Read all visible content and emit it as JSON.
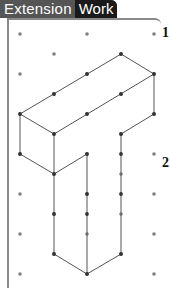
{
  "header": {
    "tab_label_1": "Extension",
    "tab_label_2": "Work"
  },
  "questions": [
    {
      "number": "1",
      "x": 162,
      "y": 34
    },
    {
      "number": "2",
      "x": 162,
      "y": 164
    }
  ],
  "grid": {
    "columns_x": [
      20,
      54,
      87,
      121,
      154
    ],
    "row_spacing": 20,
    "dot_color": "#808080"
  },
  "shape": {
    "description": "Isometric drawing of a T-shaped solid on isometric dot paper",
    "line_color": "#555555",
    "vertex_color": "#333333",
    "edges": [
      [
        [
          121,
          54
        ],
        [
          154,
          74
        ]
      ],
      [
        [
          121,
          54
        ],
        [
          20,
          114
        ]
      ],
      [
        [
          154,
          74
        ],
        [
          54,
          134
        ]
      ],
      [
        [
          20,
          114
        ],
        [
          54,
          134
        ]
      ],
      [
        [
          154,
          74
        ],
        [
          154,
          114
        ]
      ],
      [
        [
          154,
          114
        ],
        [
          121,
          134
        ]
      ],
      [
        [
          20,
          114
        ],
        [
          20,
          154
        ]
      ],
      [
        [
          54,
          134
        ],
        [
          54,
          174
        ]
      ],
      [
        [
          20,
          154
        ],
        [
          54,
          174
        ]
      ],
      [
        [
          54,
          174
        ],
        [
          87,
          154
        ]
      ],
      [
        [
          87,
          154
        ],
        [
          87,
          274
        ]
      ],
      [
        [
          121,
          134
        ],
        [
          121,
          254
        ]
      ],
      [
        [
          121,
          254
        ],
        [
          87,
          274
        ]
      ],
      [
        [
          54,
          174
        ],
        [
          54,
          254
        ]
      ],
      [
        [
          54,
          254
        ],
        [
          87,
          274
        ]
      ]
    ],
    "vertices": [
      [
        121,
        54
      ],
      [
        154,
        74
      ],
      [
        87,
        74
      ],
      [
        54,
        94
      ],
      [
        121,
        94
      ],
      [
        20,
        114
      ],
      [
        87,
        114
      ],
      [
        154,
        114
      ],
      [
        54,
        134
      ],
      [
        121,
        134
      ],
      [
        20,
        154
      ],
      [
        87,
        154
      ],
      [
        121,
        154
      ],
      [
        54,
        174
      ],
      [
        87,
        194
      ],
      [
        121,
        194
      ],
      [
        54,
        214
      ],
      [
        87,
        214
      ],
      [
        54,
        254
      ],
      [
        121,
        254
      ],
      [
        87,
        274
      ]
    ]
  }
}
